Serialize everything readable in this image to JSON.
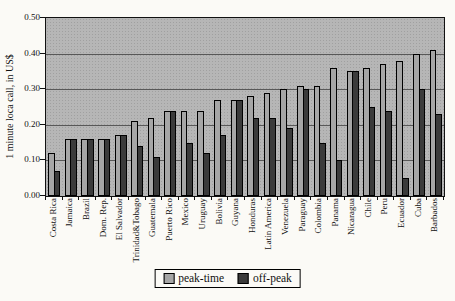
{
  "chart_data": {
    "type": "bar",
    "title": "",
    "ylabel": "1 minute loca call, in US$",
    "xlabel": "",
    "ylim": [
      0,
      0.5
    ],
    "ytick_step": 0.1,
    "yticks": [
      "0.00",
      "0.10",
      "0.20",
      "0.30",
      "0.40",
      "0.50"
    ],
    "grid": true,
    "legend_position": "bottom-center",
    "plot_background": "#b6b6b6",
    "categories": [
      "Costa Rica",
      "Jamaica",
      "Brazil",
      "Dom. Rep.",
      "El Salvador",
      "Trinidad&Tobago",
      "Guatemala",
      "Puerto Rico",
      "Mexico",
      "Uruguay",
      "Bolivia",
      "Guyana",
      "Honduras",
      "Latin America",
      "Venezuela",
      "Paraguay",
      "Colombia",
      "Panama",
      "Nicaragua",
      "Chile",
      "Peru",
      "Ecuador",
      "Cuba",
      "Barbados"
    ],
    "series": [
      {
        "name": "peak-time",
        "color": "#a6a6a6",
        "values": [
          0.12,
          0.16,
          0.16,
          0.16,
          0.17,
          0.21,
          0.22,
          0.24,
          0.24,
          0.24,
          0.27,
          0.27,
          0.28,
          0.29,
          0.3,
          0.31,
          0.31,
          0.36,
          0.35,
          0.36,
          0.37,
          0.38,
          0.4,
          0.41
        ]
      },
      {
        "name": "off-peak",
        "color": "#3b3b3b",
        "values": [
          0.07,
          0.16,
          0.16,
          0.16,
          0.17,
          0.14,
          0.11,
          0.24,
          0.15,
          0.12,
          0.17,
          0.27,
          0.22,
          0.22,
          0.19,
          0.3,
          0.15,
          0.1,
          0.35,
          0.25,
          0.24,
          0.05,
          0.3,
          0.23
        ]
      }
    ]
  }
}
